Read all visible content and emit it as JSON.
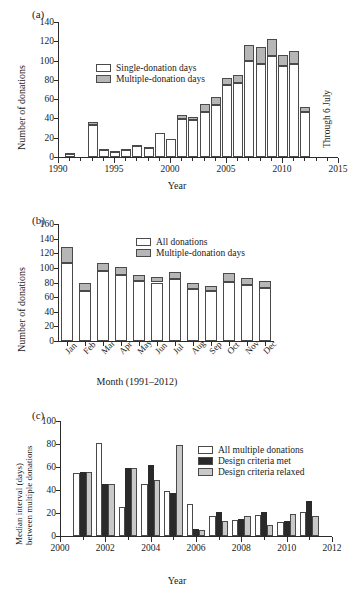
{
  "figure": {
    "panels": [
      "(a)",
      "(b)",
      "(c)"
    ]
  },
  "chart_data": [
    {
      "panel": "(a)",
      "type": "bar",
      "stacked": true,
      "title": "",
      "xlabel": "Year",
      "ylabel": "Number of donations",
      "xlim": [
        1990,
        2015
      ],
      "ylim": [
        0,
        140
      ],
      "yticks": [
        0,
        20,
        40,
        60,
        80,
        100,
        120,
        140
      ],
      "xticks": [
        1990,
        1995,
        2000,
        2005,
        2010,
        2015
      ],
      "annotation": "Through 6 July",
      "legend": [
        "Single-donation days",
        "Multiple-donation days"
      ],
      "legend_position": "upper-left-inside",
      "categories": [
        1991,
        1993,
        1994,
        1995,
        1996,
        1997,
        1998,
        1999,
        2000,
        2001,
        2002,
        2003,
        2004,
        2005,
        2006,
        2007,
        2008,
        2009,
        2010,
        2011,
        2012
      ],
      "series": [
        {
          "name": "Single-donation days",
          "values": [
            3,
            33,
            7,
            5,
            7,
            11,
            9,
            25,
            19,
            39,
            38,
            47,
            54,
            75,
            77,
            100,
            96,
            105,
            94,
            96,
            47
          ]
        },
        {
          "name": "Multiple-donation days",
          "values": [
            1,
            3,
            1,
            1,
            1,
            1,
            1,
            0,
            0,
            5,
            3,
            8,
            8,
            7,
            8,
            16,
            18,
            17,
            12,
            14,
            5
          ]
        }
      ],
      "totals": [
        4,
        36,
        8,
        6,
        8,
        12,
        10,
        25,
        19,
        44,
        41,
        55,
        62,
        82,
        85,
        116,
        114,
        122,
        106,
        110,
        52
      ]
    },
    {
      "panel": "(b)",
      "type": "bar",
      "stacked": true,
      "title": "",
      "xlabel": "Month (1991–2012)",
      "ylabel": "Number of donations",
      "ylim": [
        0,
        160
      ],
      "yticks": [
        0,
        20,
        40,
        60,
        80,
        100,
        120,
        140,
        160
      ],
      "legend": [
        "All donations",
        "Multiple-donation days"
      ],
      "legend_position": "upper-right-inside",
      "categories": [
        "Jan",
        "Feb",
        "Mar",
        "Apr",
        "May",
        "Jun",
        "Jul",
        "Aug",
        "Sep",
        "Oct",
        "Nov",
        "Dec"
      ],
      "series": [
        {
          "name": "All donations",
          "values": [
            107,
            69,
            96,
            90,
            82,
            80,
            85,
            71,
            69,
            81,
            77,
            73
          ]
        },
        {
          "name": "Multiple-donation days",
          "values": [
            22,
            11,
            10,
            11,
            8,
            7,
            10,
            8,
            6,
            12,
            9,
            9
          ]
        }
      ],
      "totals": [
        129,
        80,
        106,
        101,
        90,
        87,
        95,
        79,
        75,
        93,
        86,
        82
      ]
    },
    {
      "panel": "(c)",
      "type": "bar",
      "stacked": false,
      "grouped": true,
      "title": "",
      "xlabel": "Year",
      "ylabel": "Median interval (days) between multiple donations",
      "xlim": [
        2000,
        2012
      ],
      "ylim": [
        0,
        100
      ],
      "yticks": [
        0,
        20,
        40,
        60,
        80,
        100
      ],
      "xticks": [
        2000,
        2002,
        2004,
        2006,
        2008,
        2010,
        2012
      ],
      "legend": [
        "All multiple donations",
        "Design criteria met",
        "Design criteria relaxed"
      ],
      "legend_position": "upper-right-inside",
      "categories": [
        2001,
        2002,
        2003,
        2004,
        2005,
        2006,
        2007,
        2008,
        2009,
        2010,
        2011
      ],
      "series": [
        {
          "name": "All multiple donations",
          "values": [
            55,
            81,
            25,
            45,
            39,
            28,
            17,
            14,
            18,
            12,
            21
          ]
        },
        {
          "name": "Design criteria met",
          "values": [
            56,
            45,
            59,
            62,
            37.5,
            6,
            21,
            14.5,
            21,
            13,
            30.5
          ]
        },
        {
          "name": "Design criteria relaxed",
          "values": [
            56,
            45,
            59,
            49,
            79.5,
            5.5,
            13,
            17,
            10,
            19,
            17.5
          ]
        }
      ]
    }
  ],
  "colors": {
    "axis": "#2b2b2b",
    "single_donation": "#ffffff",
    "multiple_donation": "#b6b6b6",
    "criteria_met": "#2a2a2a",
    "criteria_relaxed": "#c9c9c9"
  }
}
